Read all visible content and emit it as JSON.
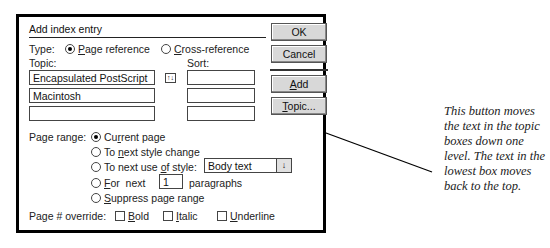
{
  "dialog": {
    "title": "Add index entry",
    "type_label": "Type:",
    "type_options": [
      {
        "label": "Page reference",
        "mnemonic": "P",
        "rest": "age reference",
        "selected": true
      },
      {
        "label": "Cross-reference",
        "mnemonic": "C",
        "rest": "ross-reference",
        "selected": false
      }
    ],
    "topic_label": "Topic:",
    "sort_label": "Sort:",
    "topic_fields": [
      "Encapsulated PostScript",
      "Macintosh",
      ""
    ],
    "sort_fields": [
      "",
      "",
      ""
    ],
    "rotate_icon": "rotate-topics-icon",
    "page_range_label": "Page range:",
    "page_range_options": [
      {
        "pre": "Cu",
        "mnemonic": "r",
        "post": "rent page",
        "label": "Current page",
        "selected": true
      },
      {
        "pre": "To ",
        "mnemonic": "n",
        "post": "ext style change",
        "label": "To next style change",
        "selected": false
      },
      {
        "pre": "To next use ",
        "mnemonic": "o",
        "post": "f style:",
        "label": "To next use of style:",
        "selected": false
      },
      {
        "pre": "",
        "mnemonic": "F",
        "post": "or  next",
        "label": "For next",
        "selected": false
      },
      {
        "pre": "",
        "mnemonic": "S",
        "post": "uppress page range",
        "label": "Suppress page range",
        "selected": false
      }
    ],
    "style_dropdown": {
      "value": "Body text",
      "arrow": "↓"
    },
    "paragraphs_value": "1",
    "paragraphs_label": "paragraphs",
    "override_label": "Page # override:",
    "override_options": [
      {
        "mnemonic": "B",
        "rest": "old",
        "label": "Bold",
        "checked": false
      },
      {
        "mnemonic": "I",
        "rest": "talic",
        "label": "Italic",
        "checked": false
      },
      {
        "mnemonic": "U",
        "rest": "nderline",
        "label": "Underline",
        "checked": false
      }
    ],
    "buttons": {
      "ok": "OK",
      "cancel": "Cancel",
      "add_mn": "A",
      "add_rest": "dd",
      "add": "Add",
      "topic_mn": "T",
      "topic_rest": "opic...",
      "topic": "Topic..."
    }
  },
  "annotation": {
    "text": "This button moves the text in the topic boxes down one level. The text in the lowest box moves back to the top."
  }
}
